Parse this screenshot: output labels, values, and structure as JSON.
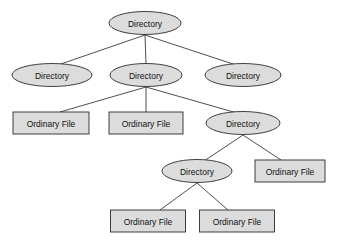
{
  "diagram": {
    "type": "tree",
    "background_color": "#ffffff",
    "node_fill_color": "#dcdcdc",
    "node_stroke_color": "#2b2b2b",
    "edge_color": "#3b3b3b",
    "labels": {
      "directory": "Directory",
      "ordinary_file": "Ordinary File"
    },
    "nodes": [
      {
        "id": "n0",
        "label": "Directory",
        "shape": "ellipse",
        "level": 0,
        "cx": 145,
        "cy": 23,
        "rx": 36,
        "ry": 11.5
      },
      {
        "id": "n1",
        "label": "Directory",
        "shape": "ellipse",
        "level": 1,
        "cx": 52,
        "cy": 75,
        "rx": 40,
        "ry": 11.5
      },
      {
        "id": "n2",
        "label": "Directory",
        "shape": "ellipse",
        "level": 1,
        "cx": 146,
        "cy": 75,
        "rx": 36,
        "ry": 11.5
      },
      {
        "id": "n3",
        "label": "Directory",
        "shape": "ellipse",
        "level": 1,
        "cx": 243,
        "cy": 75,
        "rx": 38,
        "ry": 11.5
      },
      {
        "id": "n4",
        "label": "Ordinary File",
        "shape": "rectangle",
        "level": 2,
        "cx": 51,
        "cy": 123,
        "w": 76,
        "h": 22
      },
      {
        "id": "n5",
        "label": "Ordinary File",
        "shape": "rectangle",
        "level": 2,
        "cx": 146,
        "cy": 123,
        "w": 74,
        "h": 22
      },
      {
        "id": "n6",
        "label": "Directory",
        "shape": "ellipse",
        "level": 2,
        "cx": 243,
        "cy": 123,
        "rx": 37,
        "ry": 11.5
      },
      {
        "id": "n7",
        "label": "Directory",
        "shape": "ellipse",
        "level": 3,
        "cx": 197,
        "cy": 171,
        "rx": 35,
        "ry": 11.5
      },
      {
        "id": "n8",
        "label": "Ordinary File",
        "shape": "rectangle",
        "level": 3,
        "cx": 290,
        "cy": 171,
        "w": 70,
        "h": 22
      },
      {
        "id": "n9",
        "label": "Ordinary File",
        "shape": "rectangle",
        "level": 4,
        "cx": 148,
        "cy": 221,
        "w": 75,
        "h": 22
      },
      {
        "id": "n10",
        "label": "Ordinary File",
        "shape": "rectangle",
        "level": 4,
        "cx": 237,
        "cy": 221,
        "w": 75,
        "h": 22
      }
    ],
    "edges": [
      {
        "from": "n0",
        "to": "n1",
        "x1": 145,
        "y1": 35,
        "x2": 58,
        "y2": 65
      },
      {
        "from": "n0",
        "to": "n2",
        "x1": 145,
        "y1": 35,
        "x2": 146,
        "y2": 64
      },
      {
        "from": "n0",
        "to": "n3",
        "x1": 145,
        "y1": 35,
        "x2": 236,
        "y2": 65
      },
      {
        "from": "n2",
        "to": "n4",
        "x1": 146,
        "y1": 87,
        "x2": 60,
        "y2": 112
      },
      {
        "from": "n2",
        "to": "n5",
        "x1": 146,
        "y1": 87,
        "x2": 146,
        "y2": 112
      },
      {
        "from": "n2",
        "to": "n6",
        "x1": 146,
        "y1": 87,
        "x2": 237,
        "y2": 113
      },
      {
        "from": "n6",
        "to": "n7",
        "x1": 243,
        "y1": 135,
        "x2": 204,
        "y2": 161
      },
      {
        "from": "n6",
        "to": "n8",
        "x1": 243,
        "y1": 135,
        "x2": 281,
        "y2": 160
      },
      {
        "from": "n7",
        "to": "n9",
        "x1": 197,
        "y1": 183,
        "x2": 160,
        "y2": 210
      },
      {
        "from": "n7",
        "to": "n10",
        "x1": 197,
        "y1": 183,
        "x2": 228,
        "y2": 210
      }
    ]
  }
}
